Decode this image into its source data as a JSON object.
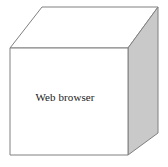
{
  "diagram": {
    "type": "3d-cube",
    "labels": {
      "front_face": "Web browser"
    },
    "colors": {
      "front_face_fill": "#ffffff",
      "top_face_fill": "#ffffff",
      "right_face_fill": "#c9c9c9",
      "edge_stroke": "#808080",
      "label_color": "#1a1a1a",
      "background": "#ffffff"
    },
    "geometry": {
      "front_face_points": "10,48 128,48 128,155 10,155",
      "top_face_points": "10,48 42,7 158,7 128,48",
      "right_face_points": "128,48 158,7 158,133 128,155",
      "label_x": 65,
      "label_y": 101
    }
  }
}
